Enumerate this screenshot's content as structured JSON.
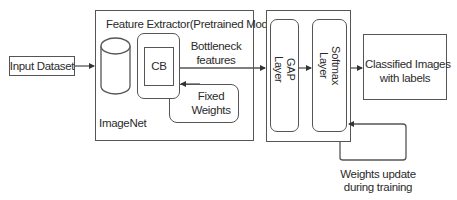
{
  "diagram": {
    "type": "flowchart",
    "nodes": {
      "input_dataset": {
        "label": "Input Dataset"
      },
      "feature_extractor": {
        "title": "Feature Extractor(Pretrained Model)"
      },
      "imagenet": {
        "label": "ImageNet",
        "shape": "cylinder"
      },
      "cb": {
        "label": "CB"
      },
      "fixed_weights": {
        "label_line1": "Fixed",
        "label_line2": "Weights"
      },
      "bottleneck": {
        "label_line1": "Bottleneck",
        "label_line2": "features"
      },
      "gap_layer": {
        "label_line1": "GAP",
        "label_line2": "Layer"
      },
      "softmax_layer": {
        "label_line1": "Softmax",
        "label_line2": "Layer"
      },
      "classified": {
        "label_line1": "Classified Images",
        "label_line2": "with labels"
      },
      "weights_update": {
        "label_line1": "Weights update",
        "label_line2": "during training"
      }
    },
    "edges": [
      {
        "from": "Input Dataset",
        "to": "Feature Extractor(Pretrained Model)"
      },
      {
        "from": "CB",
        "to": "GAP Layer",
        "label": "Bottleneck features"
      },
      {
        "from": "Fixed Weights",
        "to": "CB"
      },
      {
        "from": "GAP Layer",
        "to": "Softmax Layer"
      },
      {
        "from": "Softmax Layer",
        "to": "Classified Images with labels"
      },
      {
        "from": "Weights update during training",
        "to": "Softmax Layer"
      }
    ],
    "colors": {
      "stroke": "#555555",
      "text": "#2b2b2b",
      "background": "#ffffff"
    }
  }
}
